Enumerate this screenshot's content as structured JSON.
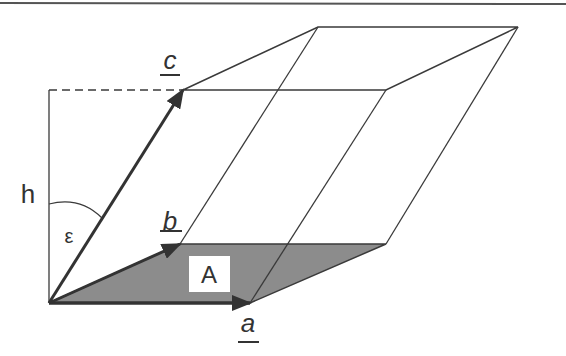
{
  "diagram": {
    "labels": {
      "a": "a",
      "b": "b",
      "c": "c",
      "h": "h",
      "epsilon": "ε",
      "area": "A"
    },
    "colors": {
      "line": "#3a3a3a",
      "base_fill": "#8a8a8a",
      "label_bg": "#ffffff"
    }
  }
}
